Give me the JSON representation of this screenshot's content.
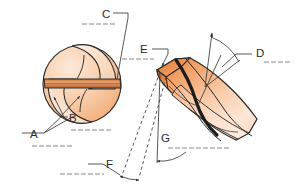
{
  "diagram": {
    "type": "technical-illustration",
    "background_color": "#ffffff",
    "line_color": "#3a3a3a",
    "blank_line_color": "#7a7a7a",
    "colors": {
      "flute_light": "#fbe3cf",
      "flute_mid": "#f3b98a",
      "flute_dark": "#e8874b",
      "body_highlight": "#fde8d6",
      "body_shadow": "#d9743a",
      "outline": "#2a2a2a",
      "web_band": "#e09a63"
    },
    "labels": [
      {
        "id": "A",
        "text": "A",
        "x": 28,
        "y": 138,
        "blank_side": "right"
      },
      {
        "id": "B",
        "text": "B",
        "x": 70,
        "y": 121,
        "blank_side": "right"
      },
      {
        "id": "C",
        "text": "C",
        "x": 104,
        "y": 17,
        "blank_side": "left"
      },
      {
        "id": "D",
        "text": "D",
        "x": 258,
        "y": 56,
        "blank_side": "right"
      },
      {
        "id": "E",
        "text": "E",
        "x": 143,
        "y": 52,
        "blank_side": "left"
      },
      {
        "id": "F",
        "text": "F",
        "x": 108,
        "y": 167,
        "blank_side": "left"
      },
      {
        "id": "G",
        "text": "G",
        "x": 163,
        "y": 141,
        "blank_side": "right"
      }
    ],
    "parts_shown": [
      "cross-section-view",
      "drill-body-3d",
      "helical-flute",
      "web-chisel-band",
      "helix-angle-arc",
      "point-angle-dimension",
      "clearance-angle-arc"
    ]
  }
}
